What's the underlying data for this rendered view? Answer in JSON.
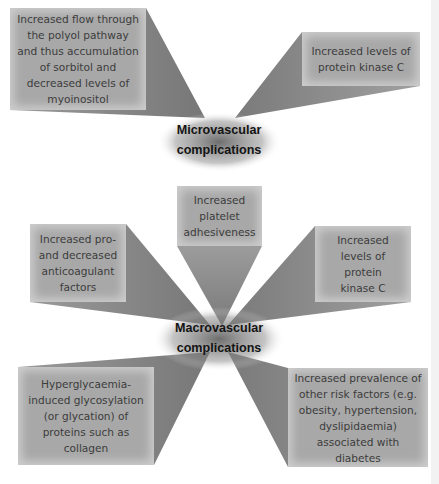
{
  "micro": {
    "hub_label_line1": "Microvascular",
    "hub_label_line2": "complications",
    "factors": [
      {
        "text": "Increased flow through the polyol pathway and thus accumulation of sorbitol and decreased levels of myoinositol"
      },
      {
        "text": "Increased levels of protein kinase C"
      }
    ]
  },
  "macro": {
    "hub_label_line1": "Macrovascular",
    "hub_label_line2": "complications",
    "factors": [
      {
        "text": "Increased platelet adhesiveness"
      },
      {
        "text": "Increased pro- and decreased anticoagulant factors"
      },
      {
        "text": "Increased levels of protein kinase C"
      },
      {
        "text": "Hyperglycaemia-induced glycosylation (or glycation) of proteins such as collagen"
      },
      {
        "text": "Increased prevalence of other risk factors (e.g. obesity, hypertension, dyslipidaemia) associated with diabetes"
      }
    ]
  },
  "colors": {
    "box": "#a8a8a8",
    "ray": "#8a8a8a",
    "hub_text": "#141414",
    "box_text": "#3c3c3c"
  }
}
